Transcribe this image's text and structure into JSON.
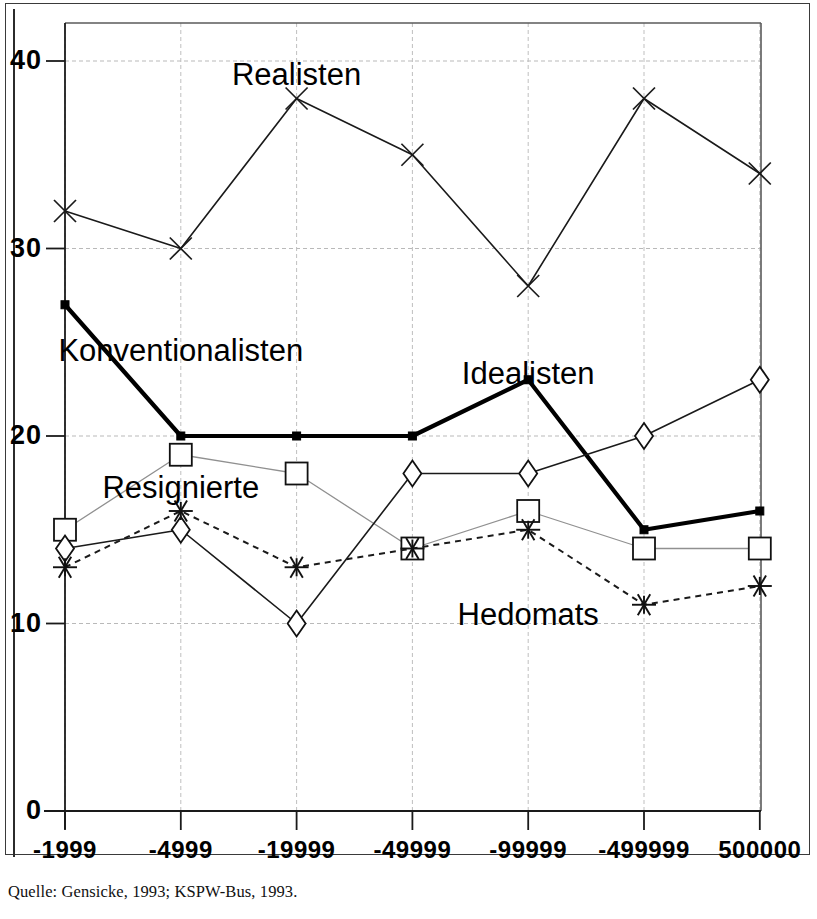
{
  "figure": {
    "caption": "Quelle: Gensicke, 1993; KSPW-Bus, 1993.",
    "frame_color": "#2b2b2b",
    "background": "#ffffff"
  },
  "chart_data": {
    "type": "line",
    "title": "",
    "xlabel": "",
    "ylabel": "",
    "categories": [
      "-1999",
      "-4999",
      "-19999",
      "-49999",
      "-99999",
      "-499999",
      "500000"
    ],
    "ylim": [
      0,
      40
    ],
    "yticks": [
      "0",
      "10",
      "20",
      "30",
      "40"
    ],
    "ytick_values": [
      0,
      10,
      20,
      30,
      40
    ],
    "grid": true,
    "legend_position": "inline-annotations",
    "series": [
      {
        "name": "Realisten",
        "marker": "x-cross",
        "line": "solid-thin",
        "color": "#1a1a1a",
        "values": [
          32,
          30,
          38,
          35,
          28,
          38,
          34
        ],
        "label_x": "-19999",
        "label_y": 38.7
      },
      {
        "name": "Konventionalisten",
        "marker": "filled-square-dot",
        "line": "solid-bold",
        "color": "#000000",
        "values": [
          27,
          20,
          20,
          20,
          23,
          15,
          16
        ],
        "label_x": "-4999",
        "label_y": 24.0
      },
      {
        "name": "Resignierte",
        "marker": "open-square",
        "line": "solid-light",
        "color": "#6a6a6a",
        "values": [
          15,
          19,
          18,
          14,
          16,
          14,
          14
        ],
        "label_x": "-4999",
        "label_y": 16.7
      },
      {
        "name": "Idealisten",
        "marker": "open-diamond",
        "line": "solid-thin",
        "color": "#1a1a1a",
        "values": [
          14,
          15,
          10,
          18,
          18,
          20,
          23
        ],
        "label_x": "-99999",
        "label_y": 22.8
      },
      {
        "name": "Hedomats",
        "marker": "asterisk",
        "line": "dotted",
        "color": "#1a1a1a",
        "values": [
          13,
          16,
          13,
          14,
          15,
          11,
          12
        ],
        "label_x": "-99999",
        "label_y": 9.9
      }
    ]
  }
}
